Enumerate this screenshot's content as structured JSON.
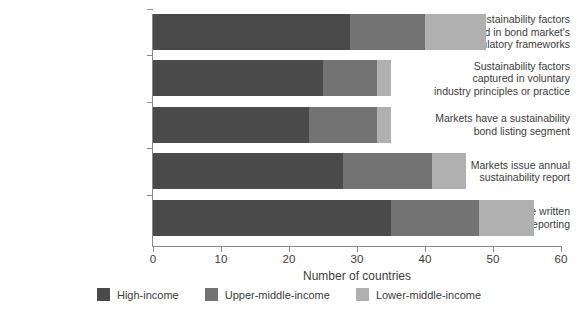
{
  "chart_data": {
    "type": "bar",
    "orientation": "horizontal",
    "stacked": true,
    "title": "",
    "xlabel": "Number of countries",
    "ylabel": "",
    "xlim": [
      0,
      60
    ],
    "xticks": [
      0,
      10,
      20,
      30,
      40,
      50,
      60
    ],
    "grid": false,
    "legend_position": "bottom",
    "categories": [
      "Sustainability factors covered in bond market's regulatory frameworks",
      "Sustainability factors captured in voluntary industry principles or practice",
      "Markets have a sustainability bond listing segment",
      "Markets issue annual sustainability report",
      "Exchanges have written guidance on ESG reporting"
    ],
    "category_lines": [
      [
        "Sustainability factors",
        "covered in bond market's",
        "regulatory frameworks"
      ],
      [
        "Sustainability factors",
        "captured in voluntary",
        "industry principles or practice"
      ],
      [
        "Markets have a sustainability",
        "bond listing segment"
      ],
      [
        "Markets issue annual",
        "sustainability report"
      ],
      [
        "Exchanges have written",
        "guidance on ESG reporting"
      ]
    ],
    "series": [
      {
        "name": "High-income",
        "color": "#4a4a4a",
        "values": [
          29,
          25,
          23,
          28,
          35
        ]
      },
      {
        "name": "Upper-middle-income",
        "color": "#737373",
        "values": [
          11,
          8,
          10,
          13,
          13
        ]
      },
      {
        "name": "Lower-middle-income",
        "color": "#b0b0b0",
        "values": [
          9,
          2,
          2,
          5,
          8
        ]
      }
    ],
    "totals": [
      49,
      35,
      35,
      46,
      56
    ]
  },
  "axis": {
    "tick_labels": [
      "0",
      "10",
      "20",
      "30",
      "40",
      "50",
      "60"
    ],
    "x_title": "Number of countries"
  },
  "legend": {
    "items": [
      {
        "label": "High-income",
        "color": "#4a4a4a"
      },
      {
        "label": "Upper-middle-income",
        "color": "#737373"
      },
      {
        "label": "Lower-middle-income",
        "color": "#b0b0b0"
      }
    ]
  },
  "colors": {
    "high_income": "#4a4a4a",
    "upper_middle_income": "#737373",
    "lower_middle_income": "#b0b0b0",
    "axis": "#8a8a8a",
    "text": "#3c3c3c",
    "background": "#ffffff"
  }
}
